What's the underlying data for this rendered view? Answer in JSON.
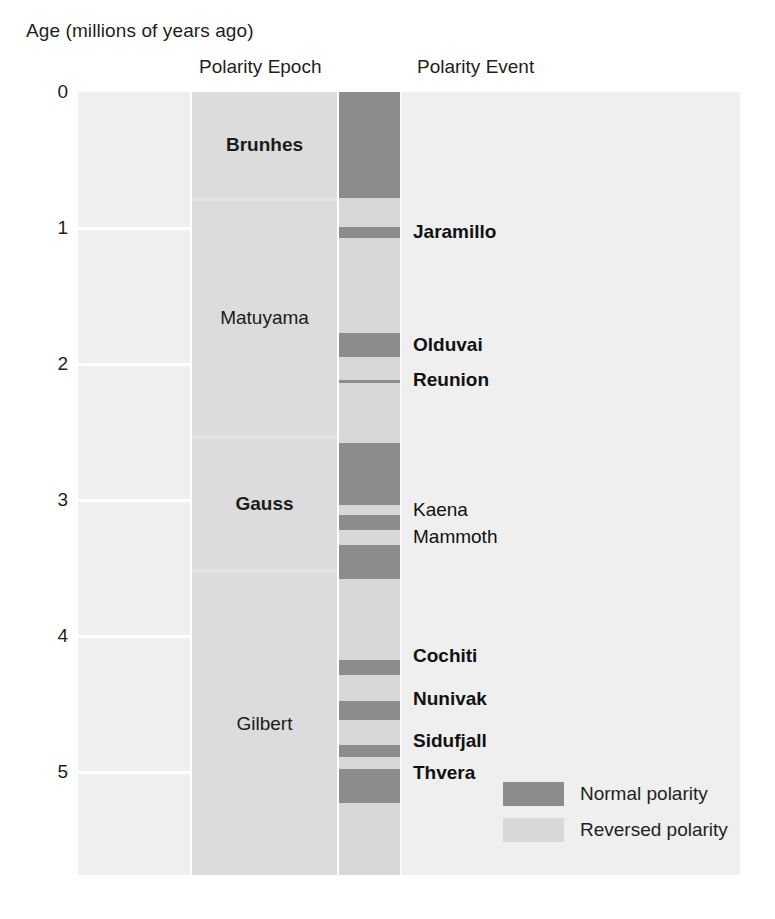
{
  "figure": {
    "axis_title": "Age (millions of years ago)",
    "column_titles": {
      "epoch": "Polarity Epoch",
      "event": "Polarity Event"
    }
  },
  "legend": {
    "position": "bottom-right",
    "items": [
      {
        "label": "Normal polarity",
        "color": "#8c8c8c",
        "key": "normal"
      },
      {
        "label": "Reversed polarity",
        "color": "#d8d8d8",
        "key": "reversed"
      }
    ]
  },
  "chart_data": {
    "type": "bar",
    "xlabel": "",
    "ylabel": "Age (millions of years ago)",
    "ylim": [
      0,
      5.76
    ],
    "y_axis_direction": "inverted",
    "grid": true,
    "tick_labels": [
      "0",
      "1",
      "2",
      "3",
      "4",
      "5"
    ],
    "tick_values": [
      0,
      1,
      2,
      3,
      4,
      5
    ],
    "columns": [
      "Age (millions of years ago)",
      "Polarity Epoch",
      "Polarity",
      "Polarity Event"
    ],
    "polarity_epochs": [
      {
        "name": "Brunhes",
        "start": 0.0,
        "end": 0.78,
        "bold": true
      },
      {
        "name": "Matuyama",
        "start": 0.8,
        "end": 2.52,
        "bold": false
      },
      {
        "name": "Gauss",
        "start": 2.55,
        "end": 3.51,
        "bold": true
      },
      {
        "name": "Gilbert",
        "start": 3.53,
        "end": 5.76,
        "bold": false
      }
    ],
    "polarity_bands": [
      {
        "polarity": "normal",
        "start": 0.0,
        "end": 0.78
      },
      {
        "polarity": "reversed",
        "start": 0.78,
        "end": 0.99
      },
      {
        "polarity": "normal",
        "start": 0.99,
        "end": 1.07
      },
      {
        "polarity": "reversed",
        "start": 1.07,
        "end": 1.77
      },
      {
        "polarity": "normal",
        "start": 1.77,
        "end": 1.95
      },
      {
        "polarity": "reversed",
        "start": 1.95,
        "end": 2.12
      },
      {
        "polarity": "normal",
        "start": 2.12,
        "end": 2.14
      },
      {
        "polarity": "reversed",
        "start": 2.14,
        "end": 2.58
      },
      {
        "polarity": "normal",
        "start": 2.58,
        "end": 3.04
      },
      {
        "polarity": "reversed",
        "start": 3.04,
        "end": 3.11
      },
      {
        "polarity": "normal",
        "start": 3.11,
        "end": 3.22
      },
      {
        "polarity": "reversed",
        "start": 3.22,
        "end": 3.33
      },
      {
        "polarity": "normal",
        "start": 3.33,
        "end": 3.58
      },
      {
        "polarity": "reversed",
        "start": 3.58,
        "end": 4.18
      },
      {
        "polarity": "normal",
        "start": 4.18,
        "end": 4.29
      },
      {
        "polarity": "reversed",
        "start": 4.29,
        "end": 4.48
      },
      {
        "polarity": "normal",
        "start": 4.48,
        "end": 4.62
      },
      {
        "polarity": "reversed",
        "start": 4.62,
        "end": 4.8
      },
      {
        "polarity": "normal",
        "start": 4.8,
        "end": 4.89
      },
      {
        "polarity": "reversed",
        "start": 4.89,
        "end": 4.98
      },
      {
        "polarity": "normal",
        "start": 4.98,
        "end": 5.23
      },
      {
        "polarity": "reversed",
        "start": 5.23,
        "end": 5.76
      }
    ],
    "polarity_events": [
      {
        "name": "Jaramillo",
        "age": 1.03,
        "bold": true
      },
      {
        "name": "Olduvai",
        "age": 1.86,
        "bold": true
      },
      {
        "name": "Reunion",
        "age": 2.12,
        "bold": true
      },
      {
        "name": "Kaena",
        "age": 3.07,
        "bold": false
      },
      {
        "name": "Mammoth",
        "age": 3.27,
        "bold": false
      },
      {
        "name": "Cochiti",
        "age": 4.15,
        "bold": true
      },
      {
        "name": "Nunivak",
        "age": 4.46,
        "bold": true
      },
      {
        "name": "Sidufjall",
        "age": 4.77,
        "bold": true
      },
      {
        "name": "Thvera",
        "age": 5.01,
        "bold": true
      }
    ]
  }
}
